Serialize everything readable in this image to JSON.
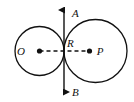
{
  "figure": {
    "kind": "geometry-diagram",
    "background_color": "#ffffff",
    "stroke_color": "#111111",
    "canvas": {
      "width": 134,
      "height": 102
    },
    "labels": {
      "center_left": "O",
      "center_right": "P",
      "tangent_point": "R",
      "tangent_line_top": "A",
      "tangent_line_bottom": "B"
    },
    "circles": [
      {
        "name": "circle-o",
        "center_label": "O",
        "cx": 39.5,
        "cy": 51,
        "r": 24.5,
        "stroke": "#111111",
        "stroke_width": 1.3,
        "fill": "none"
      },
      {
        "name": "circle-p",
        "center_label": "P",
        "cx": 95.5,
        "cy": 51,
        "r": 31.5,
        "stroke": "#111111",
        "stroke_width": 1.3,
        "fill": "none"
      }
    ],
    "points": [
      {
        "name": "point-o",
        "label": "O",
        "x": 39.5,
        "y": 51,
        "label_x": 21,
        "label_y": 55,
        "dot_r": 2.6
      },
      {
        "name": "point-p",
        "label": "P",
        "x": 89.5,
        "y": 51,
        "label_x": 98,
        "label_y": 55,
        "dot_r": 2.6
      },
      {
        "name": "point-r",
        "label": "R",
        "x": 64,
        "y": 51,
        "label_x": 66,
        "label_y": 46,
        "dot_r": 0
      }
    ],
    "segments": [
      {
        "name": "center-line-op",
        "style": "dashed",
        "x1": 39.5,
        "y1": 51,
        "x2": 89.5,
        "y2": 51,
        "dash": "4,3",
        "stroke_width": 1.3
      }
    ],
    "tangent_line": {
      "name": "tangent-line-ab",
      "x": 64,
      "y_top": 6,
      "y_bottom": 96,
      "arrow_top_label": "A",
      "arrow_bottom_label": "B",
      "arrow_top_label_x": 72,
      "arrow_top_label_y": 15,
      "arrow_bottom_label_x": 72,
      "arrow_bottom_label_y": 95,
      "stroke_width": 1.3,
      "double_headed": true
    }
  }
}
